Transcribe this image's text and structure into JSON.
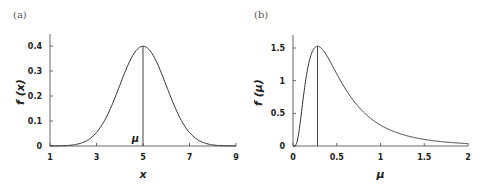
{
  "chart_data": [
    {
      "type": "line",
      "panel_label": "(a)",
      "title": "",
      "xlabel": "x",
      "ylabel": "f (x)",
      "xlim": [
        1,
        9
      ],
      "ylim": [
        0,
        0.45
      ],
      "xticks": [
        "1",
        "3",
        "5",
        "7",
        "9"
      ],
      "yticks": [
        "0",
        "0.1",
        "0.2",
        "0.3",
        "0.4"
      ],
      "grid": false,
      "legend": null,
      "annotation": {
        "text": "μ",
        "x": 5,
        "note": "vertical line at mean from 0 to peak"
      },
      "series": [
        {
          "name": "normal pdf (μ=5, σ=1)",
          "x": [
            1,
            1.5,
            2,
            2.5,
            3,
            3.5,
            4,
            4.5,
            5,
            5.5,
            6,
            6.5,
            7,
            7.5,
            8,
            8.5,
            9
          ],
          "y": [
            0.0001,
            0.0009,
            0.0044,
            0.0175,
            0.054,
            0.1295,
            0.242,
            0.3521,
            0.3989,
            0.3521,
            0.242,
            0.1295,
            0.054,
            0.0175,
            0.0044,
            0.0009,
            0.0001
          ]
        }
      ]
    },
    {
      "type": "line",
      "panel_label": "(b)",
      "title": "",
      "xlabel": "μ",
      "ylabel": "f (μ)",
      "xlim": [
        0,
        2
      ],
      "ylim": [
        0,
        1.7
      ],
      "xticks": [
        "0",
        "0.5",
        "1",
        "1.5",
        "2"
      ],
      "yticks": [
        "0",
        "0.5",
        "1",
        "1.5"
      ],
      "grid": false,
      "legend": null,
      "annotation": {
        "text": "",
        "x": 0.28,
        "note": "vertical line at mode from 0 to peak"
      },
      "series": [
        {
          "name": "lognormal-like pdf (mode≈0.28, peak≈1.52)",
          "x": [
            0,
            0.02,
            0.05,
            0.1,
            0.15,
            0.2,
            0.28,
            0.35,
            0.4,
            0.5,
            0.6,
            0.7,
            0.8,
            0.9,
            1.0,
            1.1,
            1.2,
            1.3,
            1.4,
            1.5,
            1.6,
            1.8,
            2.0
          ],
          "y": [
            0,
            0.45,
            0.92,
            1.3,
            1.45,
            1.51,
            1.52,
            1.47,
            1.41,
            1.24,
            1.04,
            0.85,
            0.67,
            0.52,
            0.39,
            0.29,
            0.21,
            0.15,
            0.1,
            0.07,
            0.05,
            0.02,
            0.01
          ]
        }
      ]
    }
  ]
}
